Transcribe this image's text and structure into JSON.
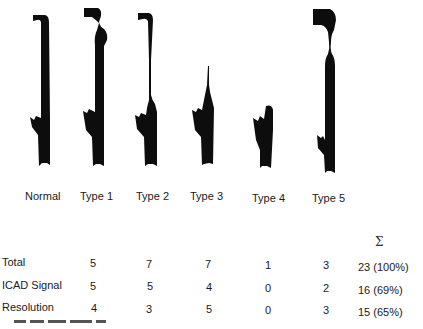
{
  "figure": {
    "types": [
      {
        "label": "Normal"
      },
      {
        "label": "Type 1"
      },
      {
        "label": "Type 2"
      },
      {
        "label": "Type 3"
      },
      {
        "label": "Type 4"
      },
      {
        "label": "Type 5"
      }
    ],
    "silhouette_color": "#0d0d0d"
  },
  "table": {
    "sum_symbol": "Σ",
    "rows": [
      {
        "label": "Total",
        "values": [
          "5",
          "7",
          "7",
          "1",
          "3"
        ],
        "sum": "23 (100%)"
      },
      {
        "label": "ICAD Signal",
        "values": [
          "5",
          "5",
          "4",
          "0",
          "2"
        ],
        "sum": "16 (69%)"
      },
      {
        "label": "Resolution",
        "values": [
          "4",
          "3",
          "5",
          "0",
          "3"
        ],
        "sum": "15 (65%)"
      }
    ]
  }
}
